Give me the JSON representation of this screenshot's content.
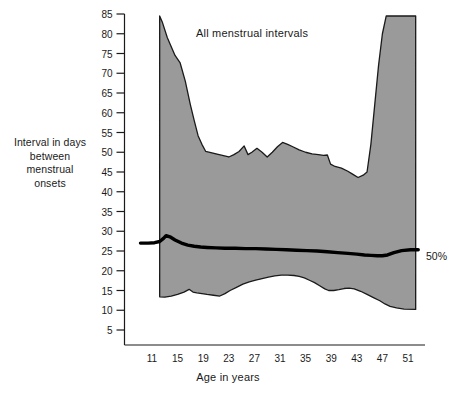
{
  "chart_data": {
    "type": "area",
    "title": "All menstrual intervals",
    "xlabel": "Age in years",
    "ylabel": "Interval in days between menstrual onsets",
    "ylabel_lines": [
      "Interval in days",
      "between",
      "menstrual",
      "onsets"
    ],
    "xlim": [
      9,
      53
    ],
    "ylim": [
      0,
      86
    ],
    "grid": false,
    "legend_position": "right-inline",
    "x_ticks": [
      11,
      15,
      19,
      23,
      27,
      31,
      35,
      39,
      43,
      47,
      51
    ],
    "y_ticks": [
      5,
      10,
      15,
      20,
      25,
      30,
      35,
      40,
      45,
      50,
      55,
      60,
      65,
      70,
      75,
      80,
      85
    ],
    "band_fill_color": "#9a9a9a",
    "band_edge_color": "#1a1a1a",
    "median_color": "#000000",
    "annotations": [
      {
        "name": "median-percentile-label",
        "text": "50%",
        "x": 52.8,
        "y": 25.3
      }
    ],
    "series": [
      {
        "name": "Upper boundary (approx. 95th percentile)",
        "x": [
          12.2,
          12.6,
          13.4,
          14.6,
          15.4,
          16.2,
          17.0,
          17.6,
          18.2,
          18.8,
          19.4,
          20.2,
          21.0,
          22.0,
          23.0,
          23.8,
          24.6,
          25.4,
          26.0,
          26.6,
          27.4,
          28.2,
          29.0,
          29.8,
          30.6,
          31.4,
          32.2,
          33.0,
          34.0,
          35.0,
          36.0,
          37.0,
          37.8,
          38.4,
          38.9,
          39.6,
          40.6,
          41.6,
          42.4,
          43.2,
          44.0,
          44.6,
          45.2,
          45.8,
          46.4,
          47.0,
          47.6,
          52.2
        ],
        "values": [
          84.5,
          83.0,
          79.0,
          74.5,
          72.6,
          68.0,
          62.0,
          58.0,
          54.2,
          52.0,
          50.2,
          49.9,
          49.6,
          49.2,
          48.8,
          49.4,
          50.2,
          51.6,
          49.4,
          50.0,
          51.0,
          50.0,
          48.8,
          50.0,
          51.4,
          52.5,
          52.0,
          51.4,
          50.6,
          50.0,
          49.6,
          49.4,
          49.2,
          49.3,
          47.0,
          46.4,
          46.0,
          45.2,
          44.4,
          43.6,
          44.2,
          45.0,
          52.0,
          62.0,
          72.0,
          80.0,
          84.5,
          84.5
        ]
      },
      {
        "name": "Lower boundary (approx. 5th percentile)",
        "x": [
          12.2,
          13.0,
          14.0,
          15.0,
          16.0,
          16.8,
          17.4,
          18.0,
          18.8,
          19.6,
          20.6,
          21.6,
          22.4,
          23.2,
          24.2,
          25.2,
          26.2,
          27.2,
          28.2,
          29.2,
          30.2,
          31.2,
          32.2,
          33.2,
          34.0,
          34.8,
          35.6,
          36.4,
          37.2,
          38.0,
          38.6,
          39.4,
          40.2,
          41.0,
          41.8,
          42.6,
          43.6,
          44.6,
          45.6,
          46.6,
          47.4,
          48.2,
          49.2,
          50.4,
          52.2
        ],
        "values": [
          13.4,
          13.3,
          13.6,
          14.0,
          14.6,
          15.3,
          14.6,
          14.4,
          14.2,
          14.0,
          13.8,
          13.6,
          14.2,
          15.0,
          15.8,
          16.6,
          17.2,
          17.6,
          18.0,
          18.4,
          18.7,
          18.9,
          18.9,
          18.8,
          18.6,
          18.2,
          17.6,
          17.0,
          16.2,
          15.4,
          15.0,
          15.0,
          15.2,
          15.5,
          15.6,
          15.4,
          14.8,
          14.0,
          13.2,
          12.4,
          11.6,
          11.0,
          10.6,
          10.3,
          10.2
        ]
      },
      {
        "name": "50%",
        "x": [
          9.2,
          10.4,
          11.4,
          12.2,
          12.8,
          13.2,
          13.8,
          14.6,
          15.6,
          16.6,
          17.6,
          18.6,
          19.6,
          21.0,
          22.4,
          24.0,
          25.6,
          27.2,
          28.8,
          30.4,
          32.0,
          33.6,
          35.2,
          36.8,
          38.4,
          40.0,
          41.6,
          43.0,
          44.2,
          45.2,
          46.2,
          47.0,
          47.8,
          48.8,
          50.0,
          51.4,
          52.6
        ],
        "values": [
          27.0,
          27.0,
          27.1,
          27.4,
          28.2,
          28.9,
          28.6,
          27.8,
          27.0,
          26.5,
          26.2,
          26.0,
          25.9,
          25.8,
          25.7,
          25.7,
          25.6,
          25.6,
          25.5,
          25.4,
          25.3,
          25.2,
          25.1,
          25.0,
          24.8,
          24.6,
          24.4,
          24.2,
          24.0,
          23.9,
          23.8,
          23.8,
          24.0,
          24.6,
          25.1,
          25.3,
          25.3
        ]
      }
    ]
  },
  "axis": {
    "x_title": "Age in years",
    "y_title_lines": [
      "Interval in days",
      "between",
      "menstrual",
      "onsets"
    ]
  },
  "title": "All menstrual intervals",
  "median_label": "50%"
}
